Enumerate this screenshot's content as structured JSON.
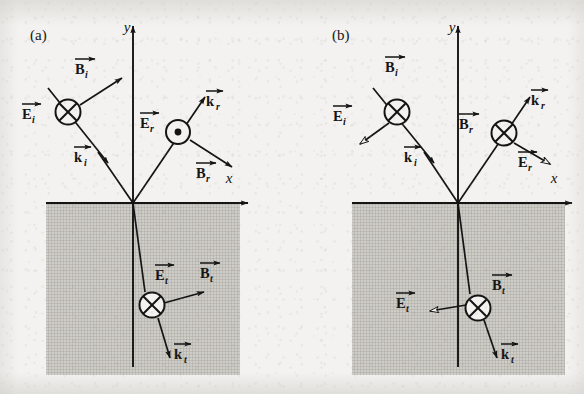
{
  "figure": {
    "background_color": "#f3f2f0",
    "ink_color": "#141414",
    "medium_fill_color": "#b9b7b2",
    "panel_count": 2
  },
  "panels": [
    {
      "id": "panel-a",
      "label": "(a)",
      "polarization": "E perpendicular to plane of incidence (E into/out of page)",
      "origin": {
        "x": 133,
        "y": 203
      },
      "axes": {
        "y_axis": {
          "label": "y",
          "label_x": 127,
          "label_y": 32,
          "top_y": 22,
          "bottom_y": 367
        },
        "x_axis": {
          "label": "x",
          "label_x": 229,
          "label_y": 183,
          "right_x": 252
        }
      },
      "medium_region": {
        "x": 46,
        "y": 203,
        "width": 194,
        "height": 172
      },
      "vectors": [
        {
          "name": "E_i",
          "base": "E",
          "subscript": "i",
          "symbol": "circle-cross",
          "meaning": "into-page",
          "center_x": 68,
          "center_y": 112,
          "label_x": 30,
          "label_y": 117
        },
        {
          "name": "B_i",
          "base": "B",
          "subscript": "i",
          "symbol": "arrow",
          "meaning": "in-plane",
          "label_x": 80,
          "label_y": 72
        },
        {
          "name": "k_i",
          "base": "k",
          "subscript": "i",
          "symbol": "arrow",
          "meaning": "propagation",
          "label_x": 80,
          "label_y": 160
        },
        {
          "name": "E_r",
          "base": "E",
          "subscript": "r",
          "symbol": "circle-dot",
          "meaning": "out-of-page",
          "center_x": 178,
          "center_y": 132,
          "label_x": 146,
          "label_y": 126
        },
        {
          "name": "B_r",
          "base": "B",
          "subscript": "r",
          "symbol": "arrow",
          "meaning": "in-plane",
          "label_x": 201,
          "label_y": 176
        },
        {
          "name": "k_r",
          "base": "k",
          "subscript": "r",
          "symbol": "arrow",
          "meaning": "propagation",
          "label_x": 209,
          "label_y": 104
        },
        {
          "name": "E_t",
          "base": "E",
          "subscript": "t",
          "symbol": "circle-cross",
          "meaning": "into-page",
          "center_x": 152,
          "center_y": 305,
          "label_x": 160,
          "label_y": 278
        },
        {
          "name": "B_t",
          "base": "B",
          "subscript": "t",
          "symbol": "arrow",
          "meaning": "in-plane",
          "label_x": 199,
          "label_y": 276
        },
        {
          "name": "k_t",
          "base": "k",
          "subscript": "t",
          "symbol": "arrow",
          "meaning": "propagation",
          "label_x": 173,
          "label_y": 357
        }
      ]
    },
    {
      "id": "panel-b",
      "label": "(b)",
      "polarization": "E parallel to plane of incidence (B into page)",
      "origin": {
        "x": 458,
        "y": 203
      },
      "axes": {
        "y_axis": {
          "label": "y",
          "label_x": 452,
          "label_y": 32,
          "top_y": 22,
          "bottom_y": 367
        },
        "x_axis": {
          "label": "x",
          "label_x": 554,
          "label_y": 183,
          "right_x": 576
        },
        "x_axis_left": 352
      },
      "medium_region": {
        "x": 352,
        "y": 203,
        "width": 213,
        "height": 172
      },
      "vectors": [
        {
          "name": "B_i",
          "base": "B",
          "subscript": "i",
          "symbol": "circle-cross",
          "meaning": "into-page",
          "center_x": 397,
          "center_y": 112,
          "label_x": 385,
          "label_y": 70
        },
        {
          "name": "E_i",
          "base": "E",
          "subscript": "i",
          "symbol": "hollow-arrow",
          "meaning": "in-plane",
          "label_x": 340,
          "label_y": 119
        },
        {
          "name": "k_i",
          "base": "k",
          "subscript": "i",
          "symbol": "arrow",
          "meaning": "propagation",
          "label_x": 409,
          "label_y": 160
        },
        {
          "name": "B_r",
          "base": "B",
          "subscript": "r",
          "symbol": "circle-cross",
          "meaning": "into-page",
          "center_x": 504,
          "center_y": 133,
          "label_x": 466,
          "label_y": 128
        },
        {
          "name": "E_r",
          "base": "E",
          "subscript": "r",
          "symbol": "hollow-arrow",
          "meaning": "in-plane",
          "label_x": 523,
          "label_y": 165
        },
        {
          "name": "k_r",
          "base": "k",
          "subscript": "r",
          "symbol": "arrow",
          "meaning": "propagation",
          "label_x": 534,
          "label_y": 103
        },
        {
          "name": "B_t",
          "base": "B",
          "subscript": "t",
          "symbol": "circle-cross",
          "meaning": "into-page",
          "center_x": 478,
          "center_y": 308,
          "label_x": 495,
          "label_y": 288
        },
        {
          "name": "E_t",
          "base": "E",
          "subscript": "t",
          "symbol": "hollow-arrow",
          "meaning": "in-plane",
          "label_x": 410,
          "label_y": 306
        },
        {
          "name": "k_t",
          "base": "k",
          "subscript": "t",
          "symbol": "arrow",
          "meaning": "propagation",
          "label_x": 500,
          "label_y": 357
        }
      ]
    }
  ],
  "vector_glyphs": {
    "E": "E",
    "B": "B",
    "k": "k",
    "x": "x",
    "y": "y"
  },
  "icon_names": {
    "into_page": "circle-cross-icon",
    "out_of_page": "circle-dot-icon",
    "arrowhead": "arrowhead-icon",
    "hollow_arrowhead": "hollow-arrowhead-icon",
    "vector_overbar": "vector-arrow-overbar-icon"
  }
}
